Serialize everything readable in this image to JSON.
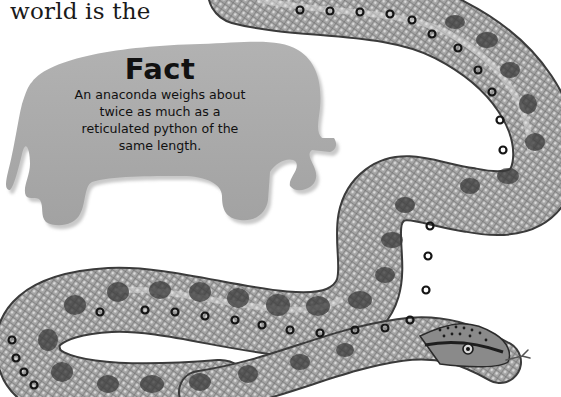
{
  "page": {
    "intro_text": "world is the"
  },
  "fact_box": {
    "shape": "elephant-silhouette",
    "title": "Fact",
    "body_lines": [
      "An anaconda weighs about",
      "twice as much as a",
      "reticulated python of the",
      "same length."
    ],
    "colors": {
      "fill": "#a9a9a9",
      "shadow": "#cfcfcf",
      "text": "#111111"
    }
  },
  "illustration": {
    "subject": "anaconda",
    "style": "grayscale",
    "colors": {
      "body": "#9a9a9a",
      "highlight": "#e6e6e6",
      "spots": "#3a3a3a",
      "ring_spots": "#151515"
    }
  }
}
